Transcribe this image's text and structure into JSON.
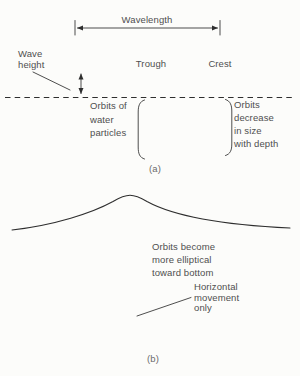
{
  "figure": {
    "background": "#fcfcfa",
    "ink_color": "#2e2e2e",
    "label_color": "#4f4f4f",
    "caption_color": "#6b6b6b"
  },
  "panel_a": {
    "caption": "(a)",
    "wavelength_label": "Wavelength",
    "wave_height": {
      "lines": [
        "Wave",
        "height"
      ]
    },
    "trough_label": "Trough",
    "crest_label": "Crest",
    "orbits_of_water": {
      "lines": [
        "Orbits of",
        "water",
        "particles"
      ]
    },
    "orbits_decrease": {
      "lines": [
        "Orbits",
        "decrease",
        "in size",
        "with depth"
      ]
    }
  },
  "panel_b": {
    "caption": "(b)",
    "orbits_become": {
      "lines": [
        "Orbits become",
        "more elliptical",
        "toward bottom"
      ]
    },
    "horizontal_movement": {
      "lines": [
        "Horizontal",
        "movement",
        "only"
      ]
    }
  }
}
